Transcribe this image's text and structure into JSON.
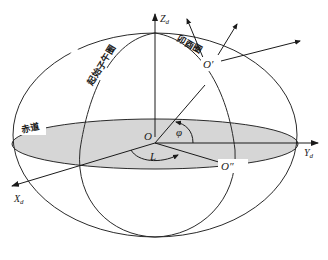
{
  "diagram": {
    "title": "",
    "colors": {
      "stroke": "#2a2a2a",
      "equator_fill": "#d6d6d6",
      "background": "#ffffff"
    },
    "labels": {
      "z_axis": "Z",
      "z_sub": "d",
      "y_axis": "Y",
      "y_sub": "d",
      "x_axis": "X",
      "x_sub": "d",
      "origin": "O",
      "o_prime": "O′",
      "o_double_prime": "O″",
      "longitude": "L",
      "latitude": "φ",
      "equator": "赤道",
      "prime_meridian": "起始子午圈",
      "local_meridian": "卯酉圈"
    },
    "nodes": [
      {
        "id": "O",
        "label": "O",
        "desc": "Earth center / origin"
      },
      {
        "id": "O1",
        "label": "O′",
        "desc": "Point on surface with local frame arrows"
      },
      {
        "id": "O2",
        "label": "O″",
        "desc": "Projection of O′ onto equatorial plane"
      }
    ],
    "edges": [
      {
        "from": "O",
        "to": "Zd",
        "desc": "Z axis"
      },
      {
        "from": "O",
        "to": "Yd",
        "desc": "Y axis"
      },
      {
        "from": "O",
        "to": "Xd",
        "desc": "X axis"
      },
      {
        "from": "O",
        "to": "O1",
        "desc": "radius to O′ (latitude φ)"
      },
      {
        "from": "O",
        "to": "O2",
        "desc": "equatorial projection (longitude L)"
      }
    ]
  }
}
